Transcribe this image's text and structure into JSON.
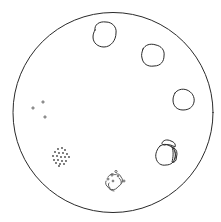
{
  "diagram": {
    "type": "circular-sequence",
    "colors": {
      "background": "#ffffff",
      "stroke": "#2a2a2a",
      "dots": "#444444"
    },
    "outer_circle": {
      "cx": 113,
      "cy": 112.5,
      "r": 100
    },
    "stages": [
      {
        "id": "stage-1",
        "shape": "intact-round-cell",
        "position": "top"
      },
      {
        "id": "stage-2",
        "shape": "intact-round-cell",
        "position": "upper-right"
      },
      {
        "id": "stage-3",
        "shape": "intact-round-cell",
        "position": "right"
      },
      {
        "id": "stage-4",
        "shape": "cell-with-cap-splitting",
        "position": "lower-right"
      },
      {
        "id": "stage-5",
        "shape": "fragmented-cell",
        "position": "bottom"
      },
      {
        "id": "stage-6",
        "shape": "scattered-dot-cluster",
        "position": "lower-left"
      },
      {
        "id": "stage-7",
        "shape": "three-sparse-dots",
        "position": "left"
      }
    ]
  }
}
